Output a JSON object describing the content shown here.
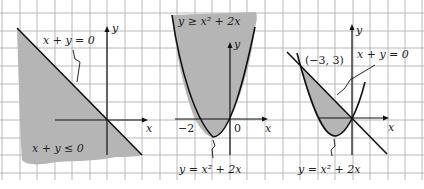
{
  "figures": [
    {
      "id": "fig-a",
      "inequality_label": "x + y ≤ 0",
      "boundary_label": "x + y = 0",
      "axis_x": "x",
      "axis_y": "y"
    },
    {
      "id": "fig-b",
      "inequality_label": "y ≥ x² + 2x",
      "boundary_label": "y = x² + 2x",
      "axis_x": "x",
      "axis_y": "y",
      "tick_labels": [
        "−2",
        "0"
      ]
    },
    {
      "id": "fig-c",
      "point_label": "(−3, 3)",
      "line_label": "x + y = 0",
      "curve_label": "y = x² + 2x",
      "axis_x": "x",
      "axis_y": "y"
    }
  ],
  "colors": {
    "grid": "#9a9a9a",
    "shade": "#b3b3b3",
    "ink": "#111111"
  }
}
